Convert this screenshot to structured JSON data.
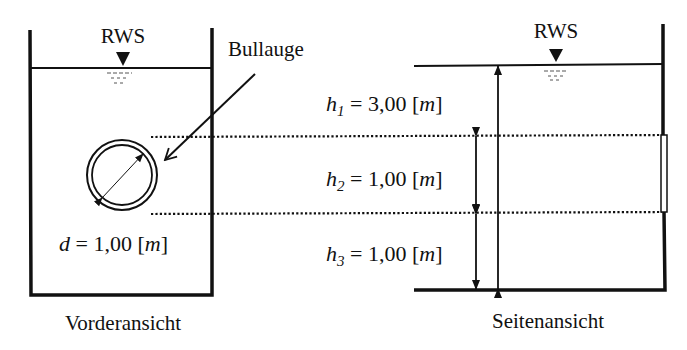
{
  "colors": {
    "stroke": "#111111",
    "background": "#ffffff"
  },
  "front_view": {
    "caption": "Vorderansicht",
    "water_level_label": "RWS",
    "porthole_label": "Bullauge",
    "diameter": {
      "symbol": "d",
      "eq": " = 1,00 [",
      "unit": "m",
      "close": "]"
    }
  },
  "side_view": {
    "caption": "Seitenansicht",
    "water_level_label": "RWS",
    "dimensions": [
      {
        "symbol": "h",
        "sub": "1",
        "eq": " = 3,00 [",
        "unit": "m",
        "close": "]"
      },
      {
        "symbol": "h",
        "sub": "2",
        "eq": " = 1,00 [",
        "unit": "m",
        "close": "]"
      },
      {
        "symbol": "h",
        "sub": "3",
        "eq": " = 1,00 [",
        "unit": "m",
        "close": "]"
      }
    ]
  }
}
